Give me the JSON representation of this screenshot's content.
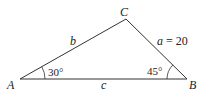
{
  "diagram": {
    "type": "triangle",
    "vertices": {
      "A": {
        "label": "A",
        "x": 20,
        "y": 79
      },
      "B": {
        "label": "B",
        "x": 187,
        "y": 79
      },
      "C": {
        "label": "C",
        "x": 126,
        "y": 19
      }
    },
    "sides": {
      "a": {
        "label": "a = 20",
        "var": "a",
        "eq": " = 20"
      },
      "b": {
        "label": "b"
      },
      "c": {
        "label": "c"
      }
    },
    "angles": {
      "A": {
        "label": "30°"
      },
      "B": {
        "label": "45°"
      }
    },
    "stroke_color": "#333333"
  }
}
